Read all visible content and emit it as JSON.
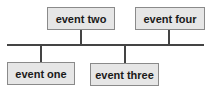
{
  "diagram": {
    "type": "timeline",
    "events": [
      {
        "label": "event one",
        "position": "below"
      },
      {
        "label": "event two",
        "position": "above"
      },
      {
        "label": "event three",
        "position": "below"
      },
      {
        "label": "event four",
        "position": "above"
      }
    ]
  }
}
